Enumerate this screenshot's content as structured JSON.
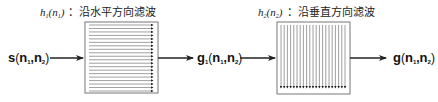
{
  "diagram": {
    "input_signal": {
      "main": "s",
      "open": "(",
      "n1": "n",
      "n1_sub": "1",
      "comma": ",",
      "n2": "n",
      "n2_sub": "2",
      "close": ")"
    },
    "intermediate_signal": {
      "main": "g",
      "main_sub": "1",
      "open": "(",
      "n1": "n",
      "n1_sub": "1",
      "comma": ",",
      "n2": "n",
      "n2_sub": "2",
      "close": ")"
    },
    "output_signal": {
      "main": "g",
      "open": "(",
      "n1": "n",
      "n1_sub": "1",
      "comma": ",",
      "n2": "n",
      "n2_sub": "2",
      "close": ")"
    },
    "filter1": {
      "func": "h",
      "func_sub": "1",
      "arg": "n",
      "arg_sub": "1",
      "colon": "：",
      "label": "沿水平方向滤波",
      "direction": "horizontal",
      "line_count": 20
    },
    "filter2": {
      "func": "h",
      "func_sub": "2",
      "arg": "n",
      "arg_sub": "2",
      "colon": "：",
      "label": "沿垂直方向滤波",
      "direction": "vertical",
      "line_count": 21
    },
    "colors": {
      "line": "#222222",
      "box_border": "#777777",
      "hatch": "#888888",
      "arrowhead": "#222222"
    }
  }
}
